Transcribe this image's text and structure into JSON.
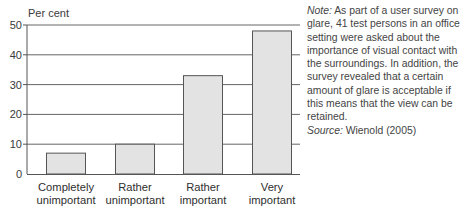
{
  "chart_data": {
    "type": "bar",
    "title": "",
    "ylabel": "Per cent",
    "xlabel": "",
    "ylim": [
      0,
      50
    ],
    "yticks": [
      0,
      10,
      20,
      30,
      40,
      50
    ],
    "grid": true,
    "categories": [
      [
        "Completely",
        "unimportant"
      ],
      [
        "Rather",
        "unimportant"
      ],
      [
        "Rather",
        "important"
      ],
      [
        "Very",
        "important"
      ]
    ],
    "values": [
      7,
      10,
      33,
      48
    ],
    "bar_color": "#e3e3e3",
    "bar_edge_color": "#555555"
  },
  "note": {
    "label": "Note:",
    "text": " As part of a user survey on glare, 41 test persons in an office setting were asked about the importance of visual contact with the surroundings. In addition, the survey revealed that a certain amount of glare is acceptable if this means that the view can be retained.",
    "source_label": "Source:",
    "source_text": " Wienold (2005)"
  }
}
